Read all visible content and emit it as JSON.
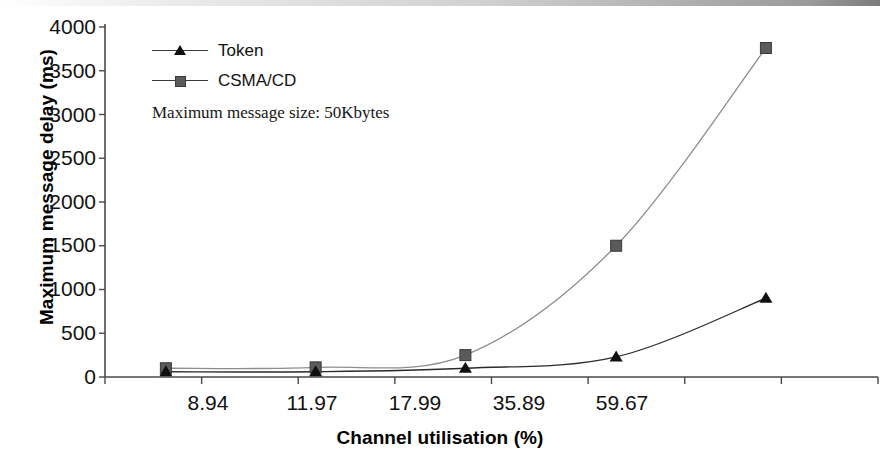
{
  "chart_data": {
    "type": "line",
    "title": "",
    "subtitle": "",
    "xlabel": "Channel utilisation (%)",
    "ylabel": "Maximum message delay (ms)",
    "categories": [
      "8.94",
      "11.97",
      "17.99",
      "35.89",
      "59.67"
    ],
    "x_tick_labels": [
      "8.94",
      "11.97",
      "17.99",
      "35.89",
      "59.67"
    ],
    "y_tick_labels": [
      "0",
      "500",
      "1000",
      "1500",
      "2000",
      "2500",
      "3000",
      "3500",
      "4000"
    ],
    "y_tick_values": [
      0,
      500,
      1000,
      1500,
      2000,
      2500,
      3000,
      3500,
      4000
    ],
    "ylim": [
      0,
      4000
    ],
    "grid": false,
    "legend_position": "top-left",
    "annotations": [
      "Maximum message size: 50Kbytes"
    ],
    "series": [
      {
        "name": "Token",
        "marker": "triangle",
        "color": "#101010",
        "values": [
          60,
          60,
          100,
          230,
          900
        ]
      },
      {
        "name": "CSMA/CD",
        "marker": "square",
        "color": "#5b5b5b",
        "values": [
          100,
          110,
          250,
          1500,
          3760
        ]
      }
    ]
  },
  "axes": {
    "y_title": "Maximum message delay (ms)",
    "x_title": "Channel utilisation (%)",
    "y_ticks": [
      "4000",
      "3500",
      "3000",
      "2500",
      "2000",
      "1500",
      "1000",
      "500",
      "0"
    ],
    "x_ticks": [
      "8.94",
      "11.97",
      "17.99",
      "35.89",
      "59.67"
    ]
  },
  "legend": {
    "items": [
      {
        "label": "Token",
        "marker": "triangle-marker-icon"
      },
      {
        "label": "CSMA/CD",
        "marker": "square-marker-icon"
      }
    ]
  },
  "annotation": {
    "text": "Maximum message size: 50Kbytes"
  }
}
